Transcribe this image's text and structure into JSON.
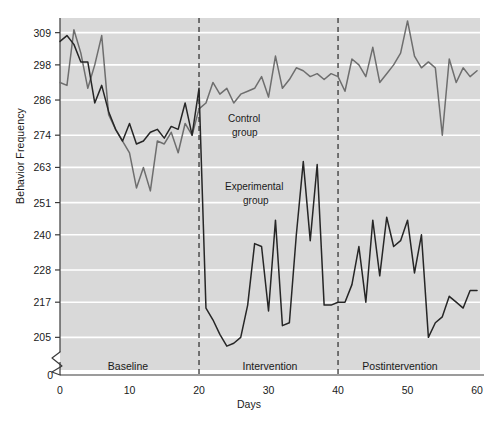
{
  "figure": {
    "background": "#ffffff",
    "plot_background": "#d9d9d9",
    "gridline_color": "#ffffff"
  },
  "axis": {
    "y_title": "Behavior Frequency",
    "x_title": "Days",
    "y_ticks": [
      "0",
      "205",
      "217",
      "228",
      "240",
      "251",
      "263",
      "274",
      "286",
      "298",
      "309"
    ],
    "x_ticks": [
      "0",
      "10",
      "20",
      "30",
      "40",
      "50",
      "60"
    ],
    "y_origin_label": "0",
    "break_symbol": "axis-break-zigzag"
  },
  "annotations": {
    "phase_1": "Baseline",
    "phase_2": "Intervention",
    "phase_3": "Postintervention",
    "control_label_line1": "Control",
    "control_label_line2": "group",
    "experimental_label_line1": "Experimental",
    "experimental_label_line2": "group",
    "phase_divider_1_day": "20",
    "phase_divider_2_day": "40"
  },
  "chart_data": {
    "type": "line",
    "title": "",
    "xlabel": "Days",
    "ylabel": "Behavior Frequency",
    "xlim": [
      0,
      61
    ],
    "ylim": [
      200,
      314
    ],
    "ytick_values": [
      205,
      217,
      228,
      240,
      251,
      263,
      274,
      286,
      298,
      309
    ],
    "xtick_values": [
      0,
      10,
      20,
      30,
      40,
      50,
      60
    ],
    "grid": true,
    "legend_position": "inline-annotation",
    "phase_dividers": [
      20,
      40
    ],
    "phases": [
      {
        "name": "Baseline",
        "start": 0,
        "end": 20
      },
      {
        "name": "Intervention",
        "start": 20,
        "end": 40
      },
      {
        "name": "Postintervention",
        "start": 40,
        "end": 61
      }
    ],
    "colors": {
      "Control group": "#6e6e6e",
      "Experimental group": "#262626"
    },
    "x": [
      0,
      1,
      2,
      3,
      4,
      5,
      6,
      7,
      8,
      9,
      10,
      11,
      12,
      13,
      14,
      15,
      16,
      17,
      18,
      19,
      20,
      21,
      22,
      23,
      24,
      25,
      26,
      27,
      28,
      29,
      30,
      31,
      32,
      33,
      34,
      35,
      36,
      37,
      38,
      39,
      40,
      41,
      42,
      43,
      44,
      45,
      46,
      47,
      48,
      49,
      50,
      51,
      52,
      53,
      54,
      55,
      56,
      57,
      58,
      59,
      60
    ],
    "series": [
      {
        "name": "Control group",
        "color": "#6e6e6e",
        "values": [
          292,
          291,
          310,
          302,
          290,
          298,
          308,
          281,
          276,
          272,
          268,
          256,
          263,
          255,
          272,
          271,
          275,
          268,
          278,
          274,
          283,
          285,
          292,
          288,
          290,
          285,
          288,
          289,
          290,
          294,
          287,
          301,
          290,
          293,
          297,
          296,
          294,
          295,
          293,
          295,
          294,
          289,
          300,
          298,
          294,
          304,
          292,
          295,
          298,
          302,
          313,
          301,
          297,
          299,
          297,
          274,
          300,
          292,
          297,
          294,
          296
        ]
      },
      {
        "name": "Experimental group",
        "color": "#262626",
        "values": [
          306,
          308,
          305,
          299,
          299,
          285,
          291,
          282,
          276,
          272,
          278,
          271,
          272,
          275,
          276,
          273,
          277,
          276,
          285,
          274,
          290,
          215,
          211,
          206,
          202,
          203,
          205,
          216,
          237,
          236,
          214,
          245,
          209,
          210,
          240,
          265,
          238,
          264,
          216,
          216,
          217,
          217,
          223,
          236,
          217,
          245,
          226,
          246,
          236,
          238,
          245,
          227,
          240,
          205,
          210,
          212,
          219,
          217,
          215,
          221,
          221
        ]
      }
    ]
  }
}
